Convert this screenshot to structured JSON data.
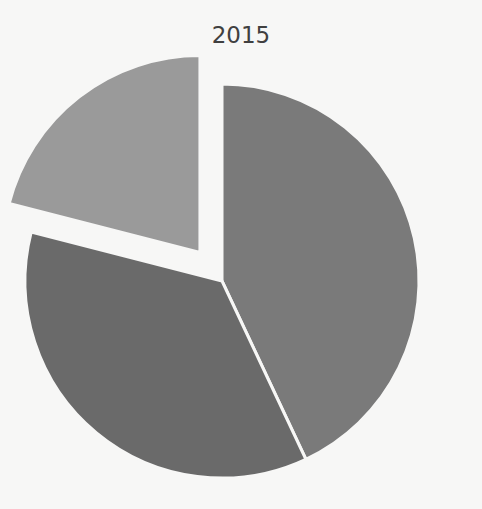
{
  "chart_data": {
    "type": "pie",
    "title": "2015",
    "categories": [
      "Slice 1",
      "Slice 2",
      "Slice 3"
    ],
    "values": [
      43,
      36,
      21
    ],
    "colors": [
      "#7a7a7a",
      "#6a6a6a",
      "#9a9a9a"
    ],
    "exploded": [
      false,
      false,
      true
    ],
    "start_angle_deg": 0,
    "direction": "clockwise",
    "legend": "none",
    "data_labels": "none"
  },
  "layout": {
    "center": [
      222,
      281
    ],
    "radius": 197,
    "explode_offset": 36,
    "gap_color": "#f7f7f6"
  }
}
